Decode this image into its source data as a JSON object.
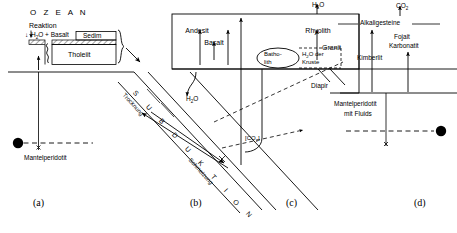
{
  "figure": {
    "panel_labels": [
      "(a)",
      "(b)",
      "(c)",
      "(d)"
    ]
  },
  "panel_a": {
    "ocean_label": "O Z E A N",
    "reaction_label": "Reaktion",
    "reaction_formula": "H₂O + Basalt",
    "sediment_label": "Sedim",
    "tholeiite_label": "Tholeiit",
    "mantle_label": "Mantelperidotit",
    "down_arrow": "↓"
  },
  "panel_b": {
    "subduction_letters": [
      "S",
      "U",
      "B",
      "D",
      "U",
      "K",
      "T",
      "I",
      "O",
      "N"
    ],
    "drying_label": "Trocknung",
    "melting_label": "Schmelzung",
    "water_label": "H₂O"
  },
  "panel_c": {
    "andesite_label": "Andesit",
    "basalt_label": "Basalt",
    "rhyolite_label": "Rhyolith",
    "granite_label": "Granit",
    "batholith_label_line1": "Batho-",
    "batholith_label_line2": "lith",
    "crust_water_line1": "H₂O der",
    "crust_water_line2": "Kruste",
    "water_escape_label": "H₂O",
    "co2_label": "[CO₂]",
    "diapir_label": "Diapir"
  },
  "panel_d": {
    "co2_label": "CO₂",
    "alkaline_label": "Alkaligesteine",
    "kimberlite_label": "Kimberlit",
    "foyaite_label_line1": "Fojait",
    "foyaite_label_line2": "Karbonatit",
    "mantle_label_line1": "Mantelperidotit",
    "mantle_label_line2": "mit  Fluids"
  },
  "colors": {
    "stroke": "#000000",
    "background": "#ffffff"
  }
}
